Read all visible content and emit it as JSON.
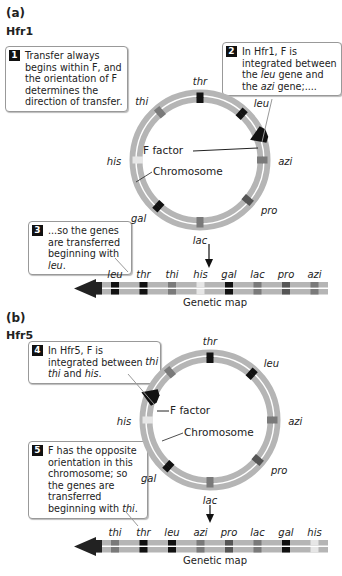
{
  "part_a": {
    "letter": "(a)",
    "strain": "Hfr1",
    "callouts": [
      {
        "num": "1",
        "text": "Transfer always begins within F, and the orientation of F determines the direction of transfer."
      },
      {
        "num": "2",
        "html_parts": [
          "In Hfr1, F is integrated between the ",
          "leu",
          " gene and the ",
          "azi",
          " gene;...."
        ]
      },
      {
        "num": "3",
        "html_parts": [
          "...so the genes are transferred beginning with ",
          "leu",
          "."
        ]
      }
    ],
    "ring_genes": [
      "thr",
      "leu",
      "azi",
      "pro",
      "lac",
      "gal",
      "his",
      "thi"
    ],
    "f_factor_label": "F factor",
    "chromosome_label": "Chromosome",
    "map_genes": [
      "leu",
      "thr",
      "thi",
      "his",
      "gal",
      "lac",
      "pro",
      "azi"
    ],
    "map_label": "Genetic map"
  },
  "part_b": {
    "letter": "(b)",
    "strain": "Hfr5",
    "callouts": [
      {
        "num": "4",
        "html_parts": [
          "In Hfr5, F is integrated between ",
          "thi",
          " and ",
          "his",
          "."
        ]
      },
      {
        "num": "5",
        "html_parts": [
          "F has the opposite orientation in this chromosome; so the genes are transferred beginning with ",
          "thi",
          "."
        ]
      }
    ],
    "ring_genes": [
      "thr",
      "leu",
      "azi",
      "pro",
      "lac",
      "gal",
      "his",
      "thi"
    ],
    "f_factor_label": "F factor",
    "chromosome_label": "Chromosome",
    "map_genes": [
      "thi",
      "thr",
      "leu",
      "azi",
      "pro",
      "lac",
      "gal",
      "his"
    ],
    "map_label": "Genetic map"
  },
  "colors": {
    "ring": "#b5b5b5",
    "black_gene": "#111111",
    "dark_gene": "#555555",
    "medium_gene": "#7a7a7a",
    "his_gene": "#e6e6e6",
    "f_factor": "#111111"
  }
}
